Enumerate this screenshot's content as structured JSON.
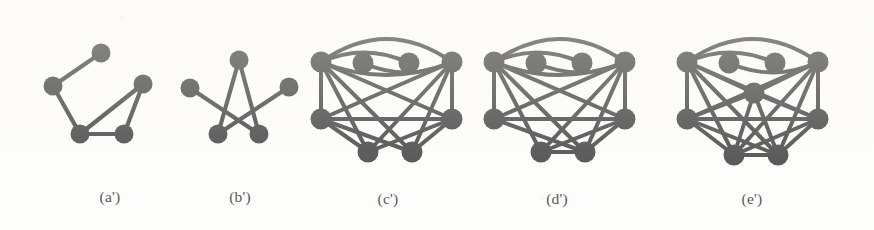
{
  "figure": {
    "background_color": "#fdfdfc",
    "ink_color": "#141414",
    "panels": [
      {
        "id": "a-prime",
        "caption": "(a')",
        "caption_x": 110,
        "caption_y": 188,
        "node_radius": 9.5,
        "edge_width": 4.2,
        "nodes": [
          {
            "name": "a-top",
            "x": 101,
            "y": 53
          },
          {
            "name": "a-left",
            "x": 53,
            "y": 86
          },
          {
            "name": "a-right",
            "x": 143,
            "y": 84
          },
          {
            "name": "a-bottom-left",
            "x": 80,
            "y": 134
          },
          {
            "name": "a-bottom-right",
            "x": 124,
            "y": 134
          }
        ],
        "edges": [
          {
            "from": 0,
            "to": 1,
            "curve": 0
          },
          {
            "from": 1,
            "to": 3,
            "curve": 0
          },
          {
            "from": 3,
            "to": 4,
            "curve": 0
          },
          {
            "from": 4,
            "to": 2,
            "curve": 0
          },
          {
            "from": 2,
            "to": 3,
            "curve": 0
          }
        ]
      },
      {
        "id": "b-prime",
        "caption": "(b')",
        "caption_x": 240,
        "caption_y": 188,
        "node_radius": 9.5,
        "edge_width": 4.2,
        "nodes": [
          {
            "name": "b-top",
            "x": 239,
            "y": 60
          },
          {
            "name": "b-left",
            "x": 190,
            "y": 88
          },
          {
            "name": "b-right",
            "x": 289,
            "y": 87
          },
          {
            "name": "b-bottom-left",
            "x": 218,
            "y": 134
          },
          {
            "name": "b-bottom-right",
            "x": 259,
            "y": 134
          }
        ],
        "edges": [
          {
            "from": 0,
            "to": 3,
            "curve": 0
          },
          {
            "from": 0,
            "to": 4,
            "curve": 0
          },
          {
            "from": 1,
            "to": 4,
            "curve": 0
          },
          {
            "from": 2,
            "to": 3,
            "curve": 0
          }
        ]
      },
      {
        "id": "c-prime",
        "caption": "(c')",
        "caption_x": 388,
        "caption_y": 190,
        "node_radius": 10.5,
        "edge_width": 4.0,
        "nodes": [
          {
            "name": "c-top-left",
            "x": 321,
            "y": 62
          },
          {
            "name": "c-top-right",
            "x": 452,
            "y": 62
          },
          {
            "name": "c-inner-left",
            "x": 363,
            "y": 63
          },
          {
            "name": "c-inner-right",
            "x": 409,
            "y": 63
          },
          {
            "name": "c-mid-left",
            "x": 321,
            "y": 119
          },
          {
            "name": "c-mid-right",
            "x": 452,
            "y": 119
          },
          {
            "name": "c-bottom-left",
            "x": 368,
            "y": 152
          },
          {
            "name": "c-bottom-right",
            "x": 412,
            "y": 152
          }
        ],
        "edges": [
          {
            "from": 0,
            "to": 1,
            "curve": -46
          },
          {
            "from": 0,
            "to": 3,
            "curve": -20
          },
          {
            "from": 1,
            "to": 2,
            "curve": -20
          },
          {
            "from": 0,
            "to": 4,
            "curve": 0
          },
          {
            "from": 1,
            "to": 5,
            "curve": 0
          },
          {
            "from": 4,
            "to": 5,
            "curve": 0
          },
          {
            "from": 0,
            "to": 5,
            "curve": 0
          },
          {
            "from": 1,
            "to": 4,
            "curve": 0
          },
          {
            "from": 0,
            "to": 6,
            "curve": 0
          },
          {
            "from": 0,
            "to": 7,
            "curve": 0
          },
          {
            "from": 1,
            "to": 6,
            "curve": 0
          },
          {
            "from": 1,
            "to": 7,
            "curve": 0
          },
          {
            "from": 4,
            "to": 6,
            "curve": 0
          },
          {
            "from": 4,
            "to": 7,
            "curve": 0
          },
          {
            "from": 5,
            "to": 6,
            "curve": 0
          },
          {
            "from": 5,
            "to": 7,
            "curve": 0
          },
          {
            "from": 0,
            "to": 1,
            "curve": 26
          }
        ]
      },
      {
        "id": "d-prime",
        "caption": "(d')",
        "caption_x": 557,
        "caption_y": 190,
        "node_radius": 10.5,
        "edge_width": 4.0,
        "nodes": [
          {
            "name": "d-top-left",
            "x": 494,
            "y": 62
          },
          {
            "name": "d-top-right",
            "x": 625,
            "y": 62
          },
          {
            "name": "d-inner-left",
            "x": 536,
            "y": 63
          },
          {
            "name": "d-inner-right",
            "x": 582,
            "y": 63
          },
          {
            "name": "d-mid-left",
            "x": 494,
            "y": 119
          },
          {
            "name": "d-mid-right",
            "x": 625,
            "y": 119
          },
          {
            "name": "d-bottom-left",
            "x": 541,
            "y": 152
          },
          {
            "name": "d-bottom-right",
            "x": 585,
            "y": 152
          }
        ],
        "edges": [
          {
            "from": 0,
            "to": 1,
            "curve": -46
          },
          {
            "from": 0,
            "to": 3,
            "curve": -20
          },
          {
            "from": 1,
            "to": 2,
            "curve": -20
          },
          {
            "from": 0,
            "to": 4,
            "curve": 0
          },
          {
            "from": 1,
            "to": 5,
            "curve": 0
          },
          {
            "from": 4,
            "to": 5,
            "curve": 0
          },
          {
            "from": 0,
            "to": 5,
            "curve": 0
          },
          {
            "from": 1,
            "to": 4,
            "curve": 0
          },
          {
            "from": 0,
            "to": 6,
            "curve": 0
          },
          {
            "from": 0,
            "to": 7,
            "curve": 0
          },
          {
            "from": 1,
            "to": 6,
            "curve": 0
          },
          {
            "from": 1,
            "to": 7,
            "curve": 0
          },
          {
            "from": 4,
            "to": 7,
            "curve": 0
          },
          {
            "from": 5,
            "to": 6,
            "curve": 0
          },
          {
            "from": 5,
            "to": 7,
            "curve": 0
          },
          {
            "from": 6,
            "to": 7,
            "curve": 0
          },
          {
            "from": 0,
            "to": 1,
            "curve": 26
          }
        ]
      },
      {
        "id": "e-prime",
        "caption": "(e')",
        "caption_x": 752,
        "caption_y": 190,
        "node_radius": 10.5,
        "edge_width": 4.0,
        "nodes": [
          {
            "name": "e-top-left",
            "x": 687,
            "y": 62
          },
          {
            "name": "e-top-right",
            "x": 818,
            "y": 62
          },
          {
            "name": "e-inner-left",
            "x": 729,
            "y": 63
          },
          {
            "name": "e-inner-right",
            "x": 775,
            "y": 63
          },
          {
            "name": "e-mid-left",
            "x": 687,
            "y": 119
          },
          {
            "name": "e-mid-right",
            "x": 818,
            "y": 119
          },
          {
            "name": "e-bottom-left",
            "x": 734,
            "y": 155
          },
          {
            "name": "e-bottom-right",
            "x": 778,
            "y": 155
          },
          {
            "name": "e-center",
            "x": 754,
            "y": 93
          }
        ],
        "edges": [
          {
            "from": 0,
            "to": 1,
            "curve": -46
          },
          {
            "from": 0,
            "to": 3,
            "curve": -20
          },
          {
            "from": 1,
            "to": 2,
            "curve": -20
          },
          {
            "from": 0,
            "to": 4,
            "curve": 0
          },
          {
            "from": 1,
            "to": 5,
            "curve": 0
          },
          {
            "from": 4,
            "to": 5,
            "curve": 0
          },
          {
            "from": 0,
            "to": 5,
            "curve": 0
          },
          {
            "from": 1,
            "to": 4,
            "curve": 0
          },
          {
            "from": 0,
            "to": 6,
            "curve": 0
          },
          {
            "from": 0,
            "to": 7,
            "curve": 0
          },
          {
            "from": 1,
            "to": 6,
            "curve": 0
          },
          {
            "from": 1,
            "to": 7,
            "curve": 0
          },
          {
            "from": 4,
            "to": 6,
            "curve": 0
          },
          {
            "from": 4,
            "to": 7,
            "curve": 0
          },
          {
            "from": 5,
            "to": 6,
            "curve": 0
          },
          {
            "from": 5,
            "to": 7,
            "curve": 0
          },
          {
            "from": 6,
            "to": 7,
            "curve": 0
          },
          {
            "from": 8,
            "to": 0,
            "curve": 0
          },
          {
            "from": 8,
            "to": 1,
            "curve": 0
          },
          {
            "from": 8,
            "to": 4,
            "curve": 0
          },
          {
            "from": 8,
            "to": 5,
            "curve": 0
          },
          {
            "from": 8,
            "to": 6,
            "curve": 0
          },
          {
            "from": 8,
            "to": 7,
            "curve": 0
          }
        ]
      }
    ]
  }
}
